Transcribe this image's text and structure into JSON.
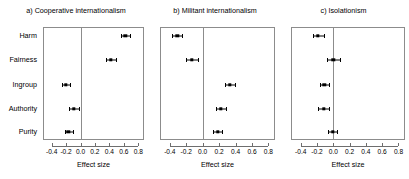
{
  "figure": {
    "background": "#ffffff",
    "point_color": "#000000",
    "frame_color": "#8c8c8c"
  },
  "chart_data": {
    "type": "scatter",
    "title": "",
    "xlabel": "Effect size",
    "ylabel": "",
    "xlim": [
      -0.52,
      0.88
    ],
    "xticks": [
      -0.4,
      -0.2,
      0.0,
      0.2,
      0.4,
      0.6,
      0.8
    ],
    "xticklabels": [
      "-0.4",
      "-0.2",
      "0.0",
      "0.2",
      "0.4",
      "0.6",
      "0.8"
    ],
    "categories": [
      "Harm",
      "Fairness",
      "Ingroup",
      "Authority",
      "Purity"
    ],
    "grid": false,
    "legend": "none",
    "reference_line": 0.0,
    "panels": [
      {
        "label": "a)",
        "title": "a) Cooperative internationalism",
        "xlabel": "Effect size",
        "points": [
          {
            "category": "Harm",
            "value": 0.62,
            "ci_low": 0.56,
            "ci_high": 0.68
          },
          {
            "category": "Fairness",
            "value": 0.42,
            "ci_low": 0.36,
            "ci_high": 0.49
          },
          {
            "category": "Ingroup",
            "value": -0.2,
            "ci_low": -0.26,
            "ci_high": -0.14
          },
          {
            "category": "Authority",
            "value": -0.09,
            "ci_low": -0.16,
            "ci_high": -0.02
          },
          {
            "category": "Purity",
            "value": -0.17,
            "ci_low": -0.22,
            "ci_high": -0.11
          }
        ]
      },
      {
        "label": "b)",
        "title": "b) Militant internationalism",
        "xlabel": "Effect size",
        "points": [
          {
            "category": "Harm",
            "value": -0.31,
            "ci_low": -0.37,
            "ci_high": -0.25
          },
          {
            "category": "Fairness",
            "value": -0.13,
            "ci_low": -0.2,
            "ci_high": -0.06
          },
          {
            "category": "Ingroup",
            "value": 0.33,
            "ci_low": 0.27,
            "ci_high": 0.39
          },
          {
            "category": "Authority",
            "value": 0.22,
            "ci_low": 0.16,
            "ci_high": 0.28
          },
          {
            "category": "Purity",
            "value": 0.18,
            "ci_low": 0.13,
            "ci_high": 0.23
          }
        ]
      },
      {
        "label": "c)",
        "title": "c) Isolationism",
        "xlabel": "Effect size",
        "points": [
          {
            "category": "Harm",
            "value": -0.19,
            "ci_low": -0.25,
            "ci_high": -0.12
          },
          {
            "category": "Fairness",
            "value": 0.0,
            "ci_low": -0.08,
            "ci_high": 0.08
          },
          {
            "category": "Ingroup",
            "value": -0.11,
            "ci_low": -0.17,
            "ci_high": -0.05
          },
          {
            "category": "Authority",
            "value": -0.12,
            "ci_low": -0.19,
            "ci_high": -0.05
          },
          {
            "category": "Purity",
            "value": -0.01,
            "ci_low": -0.07,
            "ci_high": 0.05
          }
        ]
      }
    ]
  }
}
